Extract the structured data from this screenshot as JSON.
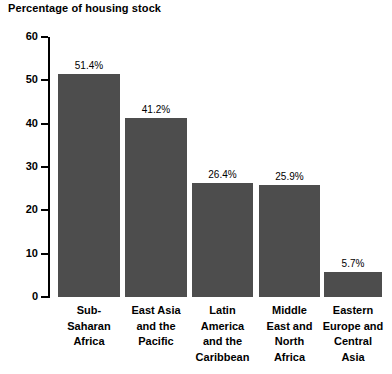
{
  "chart_data": {
    "type": "bar",
    "title": "Percentage of housing stock",
    "xlabel": "",
    "ylabel": "",
    "ylim": [
      0,
      60
    ],
    "yticks": [
      "0",
      "10",
      "20",
      "30",
      "40",
      "50",
      "60"
    ],
    "grid": false,
    "legend": false,
    "bar_color": "#4d4d4d",
    "categories": [
      "Sub-\nSaharan\nAfrica",
      "East Asia\nand the\nPacific",
      "Latin\nAmerica\nand the\nCaribbean",
      "Middle\nEast and\nNorth\nAfrica",
      "Eastern\nEurope and\nCentral\nAsia"
    ],
    "values": [
      51.4,
      41.2,
      26.4,
      25.9,
      5.7
    ],
    "value_labels": [
      "51.4%",
      "41.2%",
      "26.4%",
      "25.9%",
      "5.7%"
    ]
  }
}
